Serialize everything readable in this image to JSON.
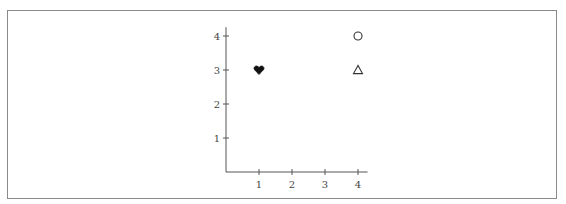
{
  "chart_data": {
    "type": "scatter",
    "title": "",
    "xlabel": "",
    "ylabel": "",
    "xlim": [
      0,
      4.2
    ],
    "ylim": [
      0,
      4.2
    ],
    "grid": false,
    "legend": null,
    "x_ticks": [
      1,
      2,
      3,
      4
    ],
    "y_ticks": [
      1,
      2,
      3,
      4
    ],
    "x_tick_labels": [
      "1",
      "2",
      "3",
      "4"
    ],
    "y_tick_labels": [
      "1",
      "2",
      "3",
      "4"
    ],
    "points": [
      {
        "x": 1,
        "y": 3,
        "marker": "heart",
        "filled": true,
        "color": "#111111"
      },
      {
        "x": 4,
        "y": 4,
        "marker": "circle",
        "filled": false,
        "color": "#333333"
      },
      {
        "x": 4,
        "y": 3,
        "marker": "triangle",
        "filled": false,
        "color": "#333333"
      }
    ]
  },
  "colors": {
    "axis": "#555555",
    "frame": "#8a8a8a",
    "marker_fill": "#111111",
    "marker_stroke": "#333333"
  }
}
